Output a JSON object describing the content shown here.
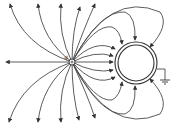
{
  "diagram": {
    "point_charge": {
      "label": "q",
      "sign": "+",
      "cx": 72,
      "cy": 62
    },
    "sphere": {
      "cx": 136,
      "cy": 63,
      "r_outer": 21,
      "r_inner": 18
    },
    "ground": {
      "symbol": "ground"
    },
    "colors": {
      "line": "#4a4a4a",
      "arrow": "#333333",
      "background": "#ffffff"
    }
  }
}
